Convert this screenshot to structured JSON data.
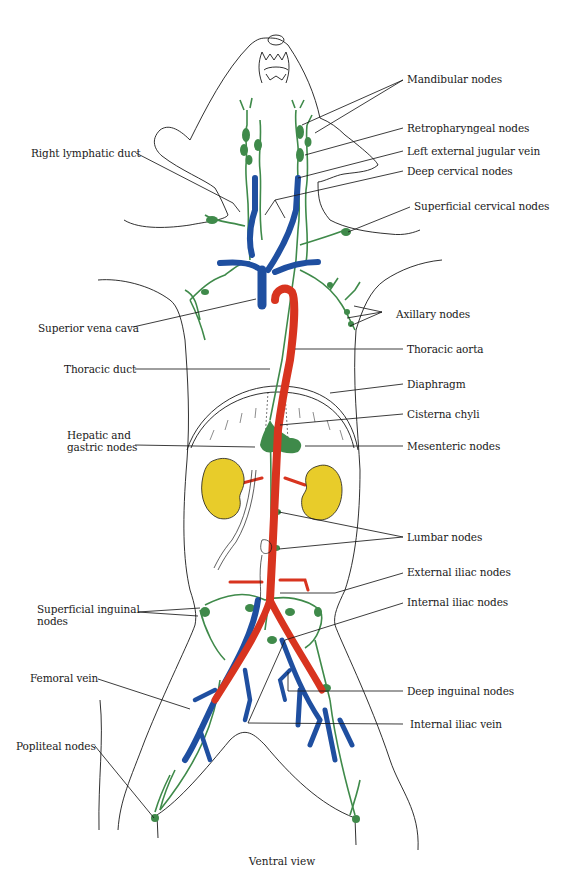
{
  "figure": {
    "caption": "Ventral view",
    "colors": {
      "outline": "#1a1a1a",
      "lymph": "#3f8a4a",
      "vein": "#1f4fa0",
      "artery": "#d8341f",
      "kidney": "#e8cc2a",
      "leader": "#1a1a1a"
    },
    "labels_left": [
      {
        "id": "right-lymphatic-duct",
        "text": "Right lymphatic duct"
      },
      {
        "id": "superior-vena-cava",
        "text": "Superior vena cava"
      },
      {
        "id": "thoracic-duct",
        "text": "Thoracic duct"
      },
      {
        "id": "hepatic-gastric-nodes-1",
        "text": "Hepatic and"
      },
      {
        "id": "hepatic-gastric-nodes-2",
        "text": "gastric nodes"
      },
      {
        "id": "superficial-inguinal-nodes-1",
        "text": "Superficial inguinal"
      },
      {
        "id": "superficial-inguinal-nodes-2",
        "text": "nodes"
      },
      {
        "id": "femoral-vein",
        "text": "Femoral vein"
      },
      {
        "id": "popliteal-nodes",
        "text": "Popliteal nodes"
      }
    ],
    "labels_right": [
      {
        "id": "mandibular-nodes",
        "text": "Mandibular nodes"
      },
      {
        "id": "retropharyngeal-nodes",
        "text": "Retropharyngeal nodes"
      },
      {
        "id": "left-external-jugular-vein",
        "text": "Left external jugular vein"
      },
      {
        "id": "deep-cervical-nodes",
        "text": "Deep cervical nodes"
      },
      {
        "id": "superficial-cervical-nodes",
        "text": "Superficial cervical nodes"
      },
      {
        "id": "axillary-nodes",
        "text": "Axillary nodes"
      },
      {
        "id": "thoracic-aorta",
        "text": "Thoracic aorta"
      },
      {
        "id": "diaphragm",
        "text": "Diaphragm"
      },
      {
        "id": "cisterna-chyli",
        "text": "Cisterna chyli"
      },
      {
        "id": "mesenteric-nodes",
        "text": "Mesenteric nodes"
      },
      {
        "id": "lumbar-nodes",
        "text": "Lumbar nodes"
      },
      {
        "id": "external-iliac-nodes",
        "text": "External iliac nodes"
      },
      {
        "id": "internal-iliac-nodes",
        "text": "Internal iliac nodes"
      },
      {
        "id": "deep-inguinal-nodes",
        "text": "Deep inguinal nodes"
      },
      {
        "id": "internal-iliac-vein",
        "text": "Internal iliac vein"
      }
    ]
  }
}
